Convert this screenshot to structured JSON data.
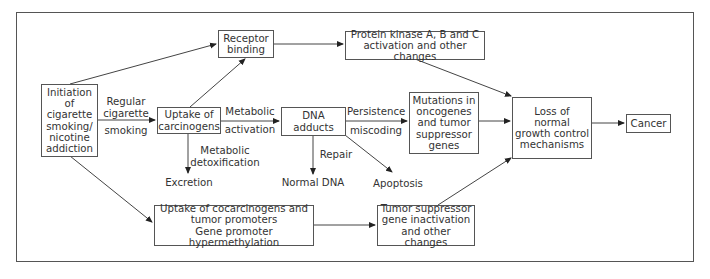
{
  "diagram": {
    "nodes": {
      "initiation": "Initiation\nof\ncigarette\nsmoking/\nnicotine\naddiction",
      "receptor_binding": "Receptor\nbinding",
      "protein_kinase": "Protein kinase A, B and C\nactivation and other changes",
      "uptake_carcinogens": "Uptake of\ncarcinogens",
      "dna_adducts": "DNA\nadducts",
      "mutations": "Mutations in\noncogenes\nand tumor\nsuppressor\ngenes",
      "loss_growth_control": "Loss of\nnormal\ngrowth control\nmechanisms",
      "cancer": "Cancer",
      "uptake_cocarcinogens": "Uptake of cocarcinogens and\ntumor promoters\nGene promoter hypermethylation",
      "tumor_suppressor": "Tumor suppressor\ngene inactivation\nand other changes",
      "excretion": "Excretion",
      "normal_dna": "Normal DNA",
      "apoptosis": "Apoptosis"
    },
    "edge_labels": {
      "regular_cigarette": "Regular\ncigarette",
      "smoking": "smoking",
      "metabolic": "Metabolic",
      "activation": "activation",
      "metabolic_detox": "Metabolic\ndetoxification",
      "persistence": "Persistence",
      "miscoding": "miscoding",
      "repair": "Repair"
    },
    "colors": {
      "line": "#444444",
      "text": "#333333",
      "border": "#555555"
    }
  }
}
